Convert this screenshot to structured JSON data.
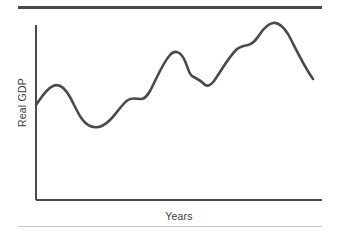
{
  "figure": {
    "background_color": "#ffffff",
    "width": 339,
    "height": 236
  },
  "rules": {
    "top_rule_color": "#4a4a4a",
    "bottom_rule_color": "#c9c9c9"
  },
  "chart_data": {
    "type": "line",
    "title": "",
    "subtitle": "",
    "xlabel": "Years",
    "ylabel": "Real GDP",
    "grid": false,
    "legend": false,
    "legend_position": "none",
    "line_color": "#4a4a4a",
    "axis_color": "#4a4a4a",
    "xlim": [
      0,
      100
    ],
    "ylim": [
      0,
      100
    ],
    "x_tick_labels": [],
    "y_tick_labels": [],
    "annotations": [],
    "series": [
      {
        "name": "Real GDP",
        "x": [
          0,
          4,
          8,
          12,
          16,
          20,
          24,
          28,
          32,
          36,
          40,
          44,
          48,
          52,
          56,
          60,
          64,
          68,
          72,
          76,
          80,
          84,
          88,
          92,
          96,
          100
        ],
        "values": [
          54,
          58,
          63,
          66,
          65,
          60,
          52,
          45,
          43,
          43,
          46,
          52,
          58,
          58,
          59,
          64,
          72,
          80,
          84,
          80,
          74,
          71,
          67,
          66,
          70,
          77
        ],
        "key_points": [
          {
            "label": "start",
            "x": 0,
            "y": 54
          },
          {
            "label": "first peak",
            "x": 13,
            "y": 66
          },
          {
            "label": "first trough",
            "x": 33,
            "y": 42
          },
          {
            "label": "plateau",
            "x": 52,
            "y": 58
          },
          {
            "label": "second peak",
            "x": 70,
            "y": 84
          },
          {
            "label": "shoulder",
            "x": 78,
            "y": 76
          },
          {
            "label": "second trough",
            "x": 86,
            "y": 66
          },
          {
            "label": "third shoulder",
            "x": 104,
            "y": 88
          },
          {
            "label": "global peak",
            "x": 118,
            "y": 100
          },
          {
            "label": "end of sharp decline",
            "x": 134,
            "y": 69
          }
        ]
      }
    ]
  },
  "path": {
    "curve_d": "M 36,105 C 41,98 46,89 53,86 C 59,83 65,88 70,97 C 76,108 81,122 90,126 C 97,129 103,127 110,120 C 117,113 122,104 128,100 C 132,97 137,99 141,99 C 145,99 147,96 150,91 C 156,80 162,64 170,55 C 175,49 181,52 185,61 C 188,68 189,74 192,76 C 196,78 200,80 204,84 C 207,87 210,86 214,81 C 221,71 228,58 236,50 C 240,46 244,46 248,45 C 253,44 256,40 260,34 C 264,28 268,24 273,23 C 278,22 283,26 288,34 C 294,45 303,65 313,79",
    "y_axis_d": "M 36,25 L 36,200",
    "x_axis_d": "M 36,200 L 322,200"
  }
}
